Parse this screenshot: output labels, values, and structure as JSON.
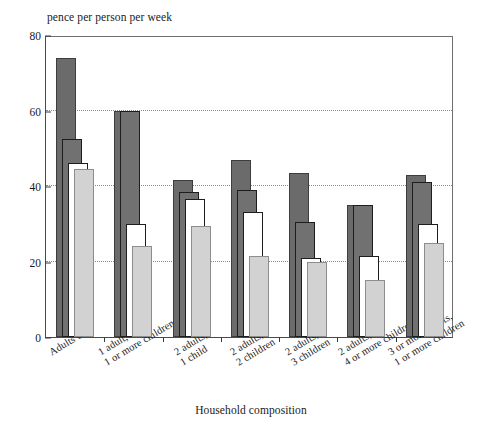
{
  "chart_data": {
    "type": "bar",
    "title": "",
    "ylabel": "pence per person per week",
    "xlabel": "Household composition",
    "ylim": [
      0,
      80
    ],
    "yticks": [
      0,
      20,
      40,
      60,
      80
    ],
    "gridlines": [
      20,
      40,
      60
    ],
    "grid": true,
    "legend": "none",
    "categories": [
      "Adults only",
      "1 adult,\n1 or more children",
      "2 adults,\n1 child",
      "2 adults,\n2 children",
      "2 adults,\n3 children",
      "2 adults,\n4 or more children",
      "3 or more adults,\n1 or more children"
    ],
    "series": [
      {
        "name": "series-1",
        "style": "dark-grey-fill",
        "color": "#6b6b6b",
        "values": [
          74,
          60,
          41.5,
          47,
          43.5,
          35,
          43
        ]
      },
      {
        "name": "series-2",
        "style": "dark-grey-fill",
        "color": "#717171",
        "values": [
          52.5,
          60,
          38.5,
          39,
          30.5,
          35,
          41
        ]
      },
      {
        "name": "series-3",
        "style": "white-fill-black-outline",
        "color": "#ffffff",
        "values": [
          46,
          30,
          36.5,
          33,
          21,
          21.5,
          30
        ]
      },
      {
        "name": "series-4",
        "style": "light-grey-fill",
        "color": "#d2d2d2",
        "values": [
          44.5,
          24,
          29.5,
          21.5,
          20,
          15,
          25
        ]
      }
    ]
  },
  "axis": {
    "y_title": "pence per person per week",
    "x_title": "Household composition",
    "y_tick_labels": [
      "0",
      "20",
      "40",
      "60",
      "80"
    ]
  },
  "categories_display": [
    {
      "line1": "Adults only",
      "line2": ""
    },
    {
      "line1": "1 adult,",
      "line2": "1 or more children"
    },
    {
      "line1": "2 adults,",
      "line2": "1 child"
    },
    {
      "line1": "2 adults,",
      "line2": "2 children"
    },
    {
      "line1": "2 adults,",
      "line2": "3 children"
    },
    {
      "line1": "2 adults,",
      "line2": "4 or more children"
    },
    {
      "line1": "3 or more adults,",
      "line2": "1 or more children"
    }
  ]
}
